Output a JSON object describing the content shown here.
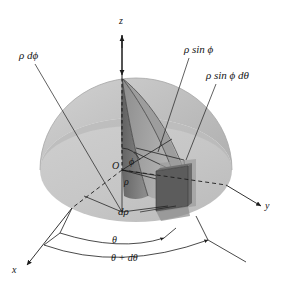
{
  "figure": {
    "background_color": "#ffffff"
  },
  "axes": [
    {
      "name": "z-axis",
      "label": "z"
    },
    {
      "name": "y-axis",
      "label": "y"
    },
    {
      "name": "x-axis",
      "label": "x"
    }
  ],
  "labels": {
    "z": "z",
    "y": "y",
    "x": "x",
    "origin": "O",
    "phi": "ϕ",
    "rho": "ρ",
    "rho_dphi": "ρ dϕ",
    "rho_sin_phi": "ρ sin ϕ",
    "rho_sin_phi_dtheta": "ρ sin ϕ dθ",
    "drho": "dρ",
    "theta": "θ",
    "theta_plus_dtheta": "θ + dθ"
  },
  "colors": {
    "dome_upper": "#c3c3c3",
    "dome_lower": "#b0b0b0",
    "disk_floor": "#c9c9c9",
    "wedge_light": "#a9a9a9",
    "wedge_dark": "#6e6e6e",
    "element_box": "#5a5a5a",
    "element_face": "#8e8e8e",
    "stroke": "#1c1c1c",
    "background": "#ffffff"
  },
  "geometry": {
    "origin": {
      "x": 122,
      "y": 170
    },
    "dome_center": {
      "x": 136,
      "y": 170
    },
    "dome_rx": 96,
    "dome_ry": 92,
    "floor_ry": 52,
    "z_axis_top": {
      "x": 122,
      "y": 35
    },
    "wedge_apex": {
      "x": 122,
      "y": 78
    },
    "element_box": {
      "x": 155,
      "y": 165,
      "w": 36,
      "h": 46
    }
  },
  "arcs": [
    {
      "name": "theta-arc",
      "label": "θ"
    },
    {
      "name": "theta-plus-dtheta-arc",
      "label": "θ + dθ"
    }
  ]
}
